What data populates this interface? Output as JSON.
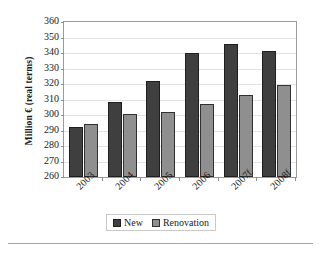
{
  "chart_data": {
    "type": "bar",
    "title": "",
    "subtitle": "",
    "xlabel": "",
    "ylabel": "Million € (real terms)",
    "categories": [
      "2003",
      "2004",
      "2005",
      "2006",
      "2007f",
      "2008f"
    ],
    "series": [
      {
        "name": "New",
        "color": "#3f3f3f",
        "values": [
          292,
          308.5,
          322,
          340,
          345.5,
          341
        ]
      },
      {
        "name": "Renovation",
        "color": "#8f8f8f",
        "values": [
          294,
          300.5,
          302,
          307,
          313,
          319.5
        ]
      }
    ],
    "ylim": [
      260,
      360
    ],
    "ytick_step": 10,
    "yticks": [
      "360",
      "350",
      "340",
      "330",
      "320",
      "310",
      "300",
      "290",
      "280",
      "270",
      "260"
    ],
    "grid": true,
    "grid_axis": "y",
    "legend_position": "bottom-center",
    "legend_entries": [
      "New",
      "Renovation"
    ]
  },
  "axes": {
    "y_title": "Million € (real terms)"
  },
  "legend": {
    "new_label": "New",
    "renovation_label": "Renovation"
  }
}
